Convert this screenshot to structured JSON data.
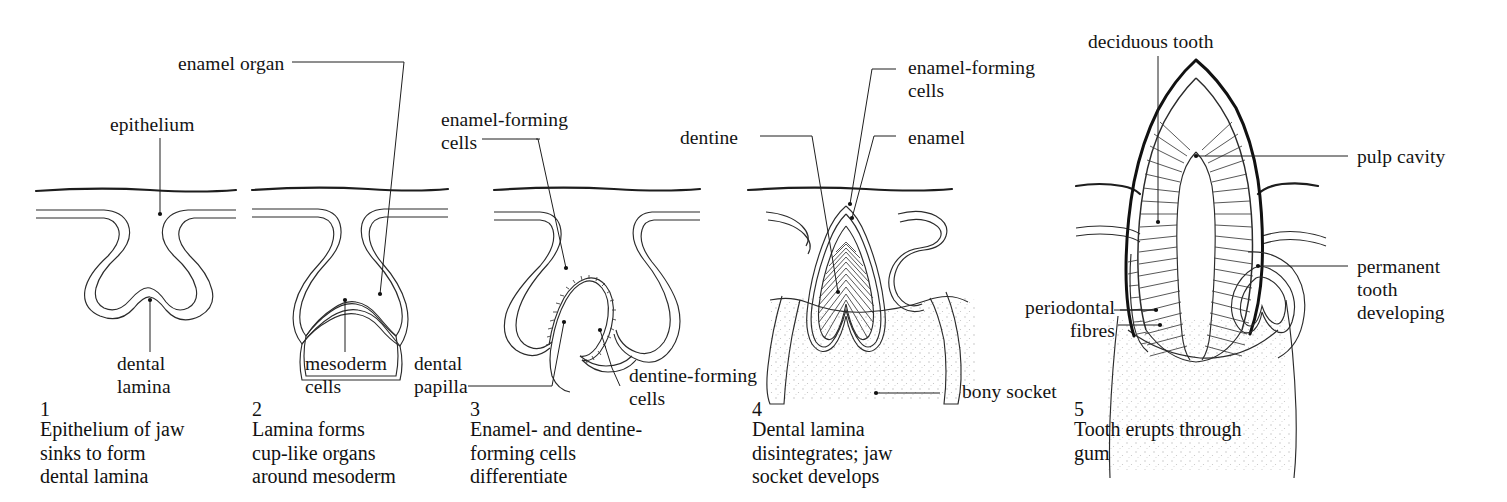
{
  "figure": {
    "background_color": "#ffffff",
    "ink_color": "#1a1a1a",
    "panel_count": 5
  },
  "panels": [
    {
      "number": "1",
      "caption": "Epithelium of jaw\nsinks to form\ndental lamina",
      "labels": [
        {
          "key": "epithelium",
          "text": "epithelium"
        },
        {
          "key": "dental_lamina",
          "text": "dental\nlamina"
        }
      ]
    },
    {
      "number": "2",
      "caption": "Lamina forms\ncup-like organs\naround mesoderm",
      "labels": [
        {
          "key": "enamel_organ",
          "text": "enamel organ"
        },
        {
          "key": "mesoderm_cells",
          "text": "mesoderm\ncells"
        }
      ]
    },
    {
      "number": "3",
      "caption": "Enamel- and dentine-\nforming cells\ndifferentiate",
      "labels": [
        {
          "key": "enamel_forming_cells",
          "text": "enamel-forming\ncells"
        },
        {
          "key": "dental_papilla",
          "text": "dental\npapilla"
        },
        {
          "key": "dentine_forming_cells",
          "text": "dentine-forming\ncells"
        }
      ]
    },
    {
      "number": "4",
      "caption": "Dental lamina\ndisintegrates; jaw\nsocket develops",
      "labels": [
        {
          "key": "enamel_forming_cells",
          "text": "enamel-forming\ncells"
        },
        {
          "key": "dentine",
          "text": "dentine"
        },
        {
          "key": "enamel",
          "text": "enamel"
        },
        {
          "key": "bony_socket",
          "text": "bony socket"
        }
      ]
    },
    {
      "number": "5",
      "caption": "Tooth erupts through\ngum",
      "labels": [
        {
          "key": "deciduous_tooth",
          "text": "deciduous tooth"
        },
        {
          "key": "pulp_cavity",
          "text": "pulp cavity"
        },
        {
          "key": "permanent_tooth",
          "text": "permanent\ntooth\ndeveloping"
        },
        {
          "key": "periodontal_fibres",
          "text": "periodontal\nfibres"
        }
      ]
    }
  ]
}
